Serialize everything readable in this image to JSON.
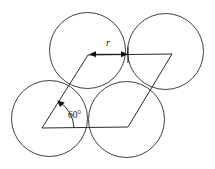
{
  "figure": {
    "background_color": "#ffffff",
    "stroke_color": "#2b2b2b",
    "annotation_color": "#111111",
    "width": 215,
    "height": 169,
    "labels": {
      "radius_label": "r",
      "angle_label": "60°"
    },
    "circles": [
      {
        "name": "top-left-circle",
        "cx": 87.5,
        "cy": 50.5,
        "r": 38.0
      },
      {
        "name": "top-right-circle",
        "cx": 165.5,
        "cy": 51.5,
        "r": 38.0
      },
      {
        "name": "bottom-left-circle",
        "cx": 49.5,
        "cy": 118.5,
        "r": 38.0
      },
      {
        "name": "bottom-right-circle",
        "cx": 126.5,
        "cy": 119.5,
        "r": 38.0
      }
    ],
    "unit_cell": {
      "name": "rhombic-unit-cell",
      "vertices": [
        {
          "name": "bottom-left-vertex",
          "x": 42,
          "y": 128
        },
        {
          "name": "bottom-right-vertex",
          "x": 128,
          "y": 127
        },
        {
          "name": "top-right-vertex",
          "x": 172,
          "y": 54
        },
        {
          "name": "top-left-vertex",
          "x": 88,
          "y": 55
        }
      ],
      "points_attr": "42,128 128,127 172,54 88,55"
    },
    "radius_dimension": {
      "name": "radius-dimension",
      "x1": 90,
      "x2": 127,
      "y": 54,
      "label_x": 108,
      "label_y": 46
    },
    "angle_annotation": {
      "name": "angle-annotation",
      "vertex_x": 42,
      "vertex_y": 128,
      "arc_path": "M 74 128 A 32 32 0 0 0 58.5 101.3",
      "label_x": 68,
      "label_y": 118
    }
  }
}
